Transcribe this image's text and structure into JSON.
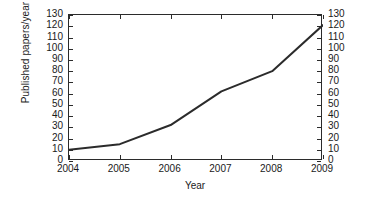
{
  "chart_data": {
    "type": "line",
    "title": "",
    "xlabel": "Year",
    "ylabel": "Published papers/year",
    "x": [
      2004,
      2005,
      2006,
      2007,
      2008,
      2009
    ],
    "values": [
      10,
      15,
      32,
      62,
      80,
      121
    ],
    "series": [
      {
        "name": "Published papers/year",
        "values": [
          10,
          15,
          32,
          62,
          80,
          121
        ],
        "color": "#2b2b2b"
      }
    ],
    "xlim": [
      2004,
      2009
    ],
    "ylim": [
      0,
      130
    ],
    "xticks": [
      "2004",
      "2005",
      "2006",
      "2007",
      "2008",
      "2009"
    ],
    "yticks": [
      "0",
      "10",
      "20",
      "30",
      "40",
      "50",
      "60",
      "70",
      "80",
      "90",
      "100",
      "110",
      "120",
      "130"
    ],
    "ytick_values": [
      0,
      10,
      20,
      30,
      40,
      50,
      60,
      70,
      80,
      90,
      100,
      110,
      120,
      130
    ],
    "y_axis_right_mirrored": true,
    "ylabel_right": "",
    "grid": false,
    "legend": null,
    "annotations": [],
    "line_color": "#2b2b2b",
    "line_width": 2,
    "markers": "none",
    "background": "#ffffff",
    "axis_color": "#2b2b2b"
  }
}
